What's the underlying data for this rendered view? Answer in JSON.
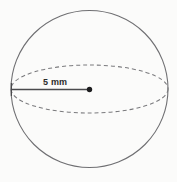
{
  "figure": {
    "kind": "sphere-diagram",
    "background_color": "#fbfbfa",
    "stroke_color": "#6f6f72",
    "dash_color": "#7a7a7d",
    "radius_line_color": "#4a4a4d",
    "label_color": "#2b2b2b",
    "labels": {
      "radius": "5 mm"
    },
    "geometry": {
      "outline_circle": {
        "cx": 89.5,
        "cy": 89.0,
        "r": 78.5,
        "style": "solid"
      },
      "equator_ellipse": {
        "cx": 89.5,
        "cy": 89.0,
        "rx": 78.5,
        "ry": 24.0,
        "style": "dashed",
        "dash_pattern": "4 3"
      },
      "radius_segment": {
        "x1": 11.0,
        "y1": 89.5,
        "x2": 89.5,
        "y2": 89.5,
        "style": "solid"
      },
      "center_point": {
        "cx": 89.5,
        "cy": 89.5,
        "r": 2.6,
        "style": "filled"
      },
      "end_tick": {
        "x": 11.0,
        "y_top": 83.0,
        "y_bottom": 96.0
      }
    }
  }
}
